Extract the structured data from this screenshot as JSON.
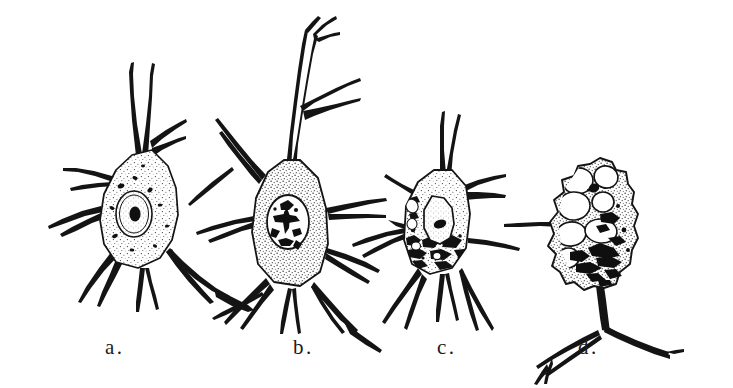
{
  "figure": {
    "background_color": "#ffffff",
    "ink_color": "#141414",
    "stipple_color": "#2a2a2a",
    "width": 733,
    "height": 388,
    "panel_count": 4
  },
  "labels": {
    "a": "a.",
    "b": "b.",
    "c": "c.",
    "d": "d."
  },
  "panels": [
    {
      "key": "a",
      "label": "a.",
      "caption_position": "below",
      "description": "Normal multipolar neuron with finely stippled cytoplasm, oval nucleus containing a single dense nucleolus, and scattered dark Nissl granules; several tapering processes radiate from the cell body.",
      "features": {
        "nucleus": "oval, outlined, centrally placed",
        "nucleolus": "single dark round body",
        "nissl_bodies": "small scattered dark flecks",
        "cytoplasm": "evenly stippled",
        "vacuoles": "none",
        "process_count": 7
      }
    },
    {
      "key": "b",
      "label": "b.",
      "caption_position": "below",
      "description": "Large multipolar neuron with long branching apical dendrite, uniformly stippled cytoplasm and an oval nucleus filled with coarse, irregular dark chromatin clumps.",
      "features": {
        "nucleus": "oval with coarse dark chromatin",
        "nucleolus": "irregular dark mass",
        "nissl_bodies": "dispersed stipple",
        "cytoplasm": "densely stippled",
        "vacuoles": "none",
        "process_count": 7
      }
    },
    {
      "key": "c",
      "label": "c.",
      "caption_position": "below",
      "description": "Neuron showing early degeneration: nucleus displaced toward the upper pole, dense clumped chromatophilic debris collected in the lower cytoplasm, and irregular cell outline.",
      "features": {
        "nucleus": "displaced, elongate, eccentric",
        "nucleolus": "single dark oval",
        "nissl_bodies": "clumped into coarse dark masses at base",
        "cytoplasm": "stippled above, granular debris below",
        "vacuoles": "small irregular clear spaces",
        "process_count": 6
      }
    },
    {
      "key": "d",
      "label": "d.",
      "caption_position": "below",
      "description": "Advanced degeneration: the cell body is distended by numerous large clear vacuoles, the nucleus is reduced to a small dark dot, and dense black pigment debris fills the lower pole above a thickened branching process.",
      "features": {
        "nucleus": "shrunken, small dark dot",
        "nucleolus": "indistinct",
        "nissl_bodies": "replaced by black pigment clumps",
        "cytoplasm": "largely displaced by vacuoles",
        "vacuoles": "numerous large round and oval clear spaces",
        "process_count": 3
      }
    }
  ]
}
